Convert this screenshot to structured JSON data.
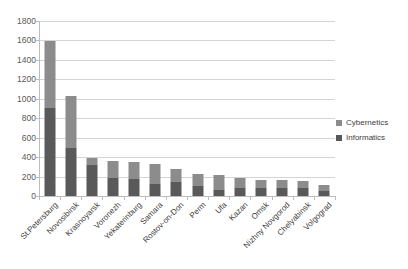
{
  "chart_data": {
    "type": "bar",
    "subtype": "stacked-vertical",
    "title": "",
    "subtitle": "",
    "xlabel": "",
    "ylabel": "",
    "ylim": [
      0,
      1800
    ],
    "ytick_step": 200,
    "yticks": [
      "1800",
      "1600",
      "1400",
      "1200",
      "1000",
      "800",
      "600",
      "400",
      "200",
      "0"
    ],
    "grid": "horizontal",
    "legend_position": "right",
    "categories": [
      "St.Petersburg",
      "Novosibirsk",
      "Krasnoyarsk",
      "Voronezh",
      "Yekaterinburg",
      "Samara",
      "Rostov-on-Don",
      "Perm",
      "Ufa",
      "Kazan",
      "Omsk",
      "Nizhny Novgorod",
      "Chelyabinsk",
      "Volgograd"
    ],
    "series": [
      {
        "name": "Informatics",
        "color": "#595959",
        "values": [
          910,
          490,
          320,
          185,
          180,
          120,
          145,
          105,
          60,
          80,
          85,
          85,
          80,
          55
        ]
      },
      {
        "name": "Cybernetics",
        "color": "#8c8c8c",
        "values": [
          680,
          540,
          70,
          180,
          175,
          210,
          135,
          125,
          160,
          110,
          85,
          85,
          75,
          55
        ]
      }
    ],
    "totals": [
      1590,
      1030,
      390,
      365,
      355,
      330,
      280,
      230,
      220,
      190,
      170,
      170,
      155,
      110
    ]
  },
  "legend": {
    "items": [
      {
        "label": "Cybernetics",
        "color": "#8c8c8c",
        "swatch_name": "legend-swatch-cybernetics"
      },
      {
        "label": "Informatics",
        "color": "#595959",
        "swatch_name": "legend-swatch-informatics"
      }
    ]
  },
  "colors": {
    "cybernetics": "#8c8c8c",
    "informatics": "#595959",
    "gridline": "#d4d4d4",
    "axis": "#bdbdbd",
    "tick_text": "#595959",
    "label_text": "#404040",
    "background": "#ffffff"
  }
}
